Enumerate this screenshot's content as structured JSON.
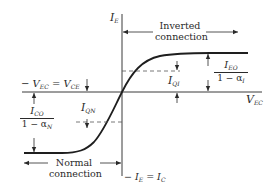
{
  "diagram": {
    "type": "transistor-characteristic",
    "axes": {
      "vertical_label_main": "I",
      "vertical_label_sub": "E",
      "horizontal_label_main": "V",
      "horizontal_label_sub": "EC",
      "left_label": "− V",
      "left_label_sub1": "EC",
      "left_label_eq": " = V",
      "left_label_sub2": "CE",
      "bottom_label": "− I",
      "bottom_label_sub1": "E",
      "bottom_label_eq": " = I",
      "bottom_label_sub2": "C"
    },
    "annotations": {
      "inverted_line1": "Inverted",
      "inverted_line2": "connection",
      "normal_line1": "Normal",
      "normal_line2": "connection",
      "iqi_main": "I",
      "iqi_sub": "QI",
      "iqn_main": "I",
      "iqn_sub": "QN",
      "ieo_num_main": "I",
      "ieo_num_sub": "EO",
      "ieo_den_main": "1 − α",
      "ieo_den_sub": "I",
      "ico_num_main": "I",
      "ico_num_sub": "CO",
      "ico_den_main": "1 − α",
      "ico_den_sub": "N"
    },
    "colors": {
      "ink": "#2a2a2a",
      "background": "#ffffff"
    }
  }
}
